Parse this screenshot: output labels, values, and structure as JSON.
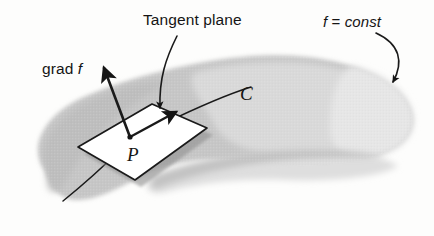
{
  "figure": {
    "title_text": "Tangent plane and gradient at a point on a level surface",
    "labels": {
      "tangent_plane": "Tangent plane",
      "level_surface": "f = const",
      "gradient": "grad f",
      "gradient_prefix": "grad",
      "gradient_italic": "f",
      "point": "P",
      "curve": "C",
      "level_surface_f": "f",
      "level_surface_eq": "=",
      "level_surface_const": "const"
    },
    "colors": {
      "ink": "#151515",
      "surface_mid": "#c2c2c2",
      "surface_light": "#dcdcdc",
      "surface_pale": "#e9e9e9",
      "plane_fill": "#ffffff",
      "plane_shadow": "#9d9d9d",
      "background": "#fdfdfc"
    },
    "geometry": {
      "plane_corners": "78,147 152,104 207,128 135,180",
      "point_p": "130,137",
      "grad_arrow": "130,137 to 104,68",
      "tangent_arrow": "130,137 to 176,112",
      "curve_c": "63,201 through 130,137 to 251,86",
      "pointer_tangent_plane": "171,40 to 161,110",
      "pointer_f_const": "374,36 to 394,84"
    }
  }
}
